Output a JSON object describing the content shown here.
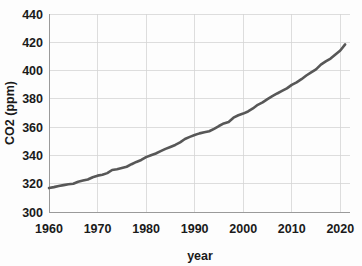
{
  "chart_data": {
    "type": "line",
    "title": "",
    "xlabel": "year",
    "ylabel": "CO2 (ppm)",
    "xlim": [
      1960,
      2022
    ],
    "ylim": [
      300,
      440
    ],
    "grid": true,
    "legend": "none",
    "x_ticks": [
      "1960",
      "1970",
      "1980",
      "1990",
      "2000",
      "2010",
      "2020"
    ],
    "x_tick_values": [
      1960,
      1970,
      1980,
      1990,
      2000,
      2010,
      2020
    ],
    "y_ticks": [
      "300",
      "320",
      "340",
      "360",
      "380",
      "400",
      "420",
      "440"
    ],
    "y_tick_values": [
      300,
      320,
      340,
      360,
      380,
      400,
      420,
      440
    ],
    "series": [
      {
        "name": "CO2 concentration",
        "color": "#575757",
        "x": [
          1960,
          1961,
          1962,
          1963,
          1964,
          1965,
          1966,
          1967,
          1968,
          1969,
          1970,
          1971,
          1972,
          1973,
          1974,
          1975,
          1976,
          1977,
          1978,
          1979,
          1980,
          1981,
          1982,
          1983,
          1984,
          1985,
          1986,
          1987,
          1988,
          1989,
          1990,
          1991,
          1992,
          1993,
          1994,
          1995,
          1996,
          1997,
          1998,
          1999,
          2000,
          2001,
          2002,
          2003,
          2004,
          2005,
          2006,
          2007,
          2008,
          2009,
          2010,
          2011,
          2012,
          2013,
          2014,
          2015,
          2016,
          2017,
          2018,
          2019,
          2020,
          2021
        ],
        "values": [
          316.9,
          317.6,
          318.4,
          319.0,
          319.6,
          320.0,
          321.4,
          322.2,
          323.0,
          324.6,
          325.7,
          326.3,
          327.5,
          329.7,
          330.2,
          331.1,
          332.0,
          333.8,
          335.4,
          336.8,
          338.8,
          340.1,
          341.4,
          343.0,
          344.6,
          346.0,
          347.4,
          349.2,
          351.6,
          353.1,
          354.4,
          355.6,
          356.4,
          357.1,
          358.8,
          360.8,
          362.6,
          363.7,
          366.7,
          368.4,
          369.6,
          371.1,
          373.2,
          375.8,
          377.5,
          379.8,
          381.9,
          383.8,
          385.6,
          387.4,
          389.9,
          391.7,
          393.9,
          396.5,
          398.7,
          400.8,
          404.2,
          406.5,
          408.5,
          411.4,
          414.2,
          418.5
        ]
      }
    ]
  },
  "axes": {
    "y_title": "CO2 (ppm)",
    "x_title": "year"
  }
}
